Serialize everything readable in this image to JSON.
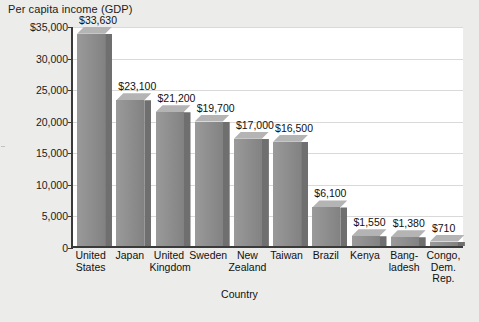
{
  "chart_data": {
    "type": "bar",
    "title": "Per capita income (GDP)",
    "xlabel": "Country",
    "ylabel": "",
    "ylim": [
      0,
      35000
    ],
    "grid": true,
    "legend": "none",
    "ytick_labels": [
      "$35,000",
      "30,000",
      "25,000",
      "20,000",
      "15,000",
      "10,000",
      "5,000",
      "0"
    ],
    "ytick_values": [
      35000,
      30000,
      25000,
      20000,
      15000,
      10000,
      5000,
      0
    ],
    "categories": [
      "United\nStates",
      "Japan",
      "United\nKingdom",
      "Sweden",
      "New\nZealand",
      "Taiwan",
      "Brazil",
      "Kenya",
      "Bang-\nladesh",
      "Congo,\nDem.\nRep."
    ],
    "values": [
      33630,
      23100,
      21200,
      19700,
      17000,
      16500,
      6100,
      1550,
      1380,
      710
    ],
    "data_labels": [
      "$33,630",
      "$23,100",
      "$21,200",
      "$19,700",
      "$17,000",
      "$16,500",
      "$6,100",
      "$1,550",
      "$1,380",
      "$710"
    ],
    "colors": {
      "bar_front": "#8d8d8d",
      "bar_side": "#6f6f6f",
      "bar_top": "#b4b4b4",
      "plot_background": "#ffffff",
      "page_background": "#ececeb",
      "axis": "#3a3a3a",
      "gridline": "#d9d9d9",
      "text": "#111111"
    }
  }
}
